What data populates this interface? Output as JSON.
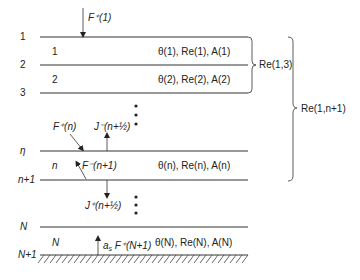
{
  "diagram": {
    "levels": [
      {
        "id": "level-1",
        "label": "1"
      },
      {
        "id": "level-2",
        "label": "2"
      },
      {
        "id": "level-3",
        "label": "3"
      },
      {
        "id": "level-eta",
        "label": "η"
      },
      {
        "id": "level-n-plus-1",
        "label": "n+1"
      },
      {
        "id": "level-N",
        "label": "N"
      },
      {
        "id": "level-N-plus-1",
        "label": "N+1"
      }
    ],
    "layers": [
      {
        "index_label": "1",
        "props": "θ(1), Re(1), A(1)"
      },
      {
        "index_label": "2",
        "props": "θ(2), Re(2), A(2)"
      },
      {
        "index_label": "n",
        "props": "θ(n), Re(n), A(n)"
      },
      {
        "index_label": "N",
        "props": "θ(N), Re(N), A(N)"
      }
    ],
    "fluxes": {
      "top_incident": "F⁺(1)",
      "down_at_n": "F⁺(n)",
      "up_half": "J⁻(n+½)",
      "up_from_below": "F⁻(n+1)",
      "down_half": "J⁺(n+½)",
      "surface_reflected_prefix": "a",
      "surface_reflected_sub": "s",
      "surface_reflected": " F⁺(N+1)"
    },
    "braces": [
      {
        "label": "Re(1,3)",
        "spans_levels": [
          "1",
          "3"
        ]
      },
      {
        "label": "Re(1,n+1)",
        "spans_levels": [
          "1",
          "n+1"
        ]
      }
    ],
    "continuation_marker": "•"
  }
}
